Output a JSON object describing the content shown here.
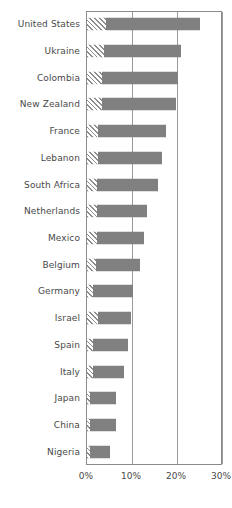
{
  "chart_data": {
    "type": "bar",
    "orientation": "horizontal",
    "title": "",
    "subtitle": "",
    "xlabel": "",
    "ylabel": "",
    "xlim": [
      0,
      32.5
    ],
    "xticks": [
      0,
      10,
      20,
      30
    ],
    "xtick_labels": [
      "0%",
      "10%",
      "20%",
      "30%"
    ],
    "grid": true,
    "legend": "none",
    "categories": [
      "United States",
      "Ukraine",
      "Colombia",
      "New Zealand",
      "France",
      "Lebanon",
      "South Africa",
      "Netherlands",
      "Mexico",
      "Belgium",
      "Germany",
      "Israel",
      "Spain",
      "Italy",
      "Japan",
      "China",
      "Nigeria"
    ],
    "values": [
      25.2,
      20.9,
      20.2,
      19.8,
      17.6,
      16.7,
      15.7,
      13.3,
      12.6,
      11.7,
      10.2,
      9.8,
      9.1,
      8.3,
      6.5,
      6.5,
      5.2
    ],
    "series": [
      {
        "name": "hatched-segment",
        "style": "diagonal-hatch",
        "values": [
          4.3,
          3.7,
          3.3,
          3.3,
          2.4,
          2.4,
          2.2,
          2.2,
          2.2,
          2.0,
          1.3,
          2.4,
          1.3,
          1.3,
          0.7,
          0.7,
          0.7
        ]
      },
      {
        "name": "solid-segment",
        "style": "solid",
        "values": [
          20.9,
          17.2,
          16.9,
          16.5,
          15.2,
          14.3,
          13.5,
          11.1,
          10.4,
          9.7,
          8.9,
          7.4,
          7.8,
          7.0,
          5.8,
          5.8,
          4.5
        ]
      }
    ],
    "colors": {
      "solid": "#808080",
      "hatch_line": "#8e8e8e",
      "hatch_background": "#ffffff",
      "axis": "#8c8c8c",
      "gridline": "#9a9a9a",
      "text": "#494949"
    }
  }
}
